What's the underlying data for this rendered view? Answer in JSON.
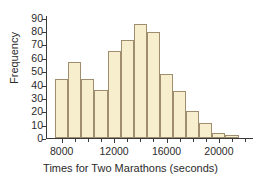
{
  "chart_data": {
    "type": "bar",
    "title": "",
    "xlabel": "Times for Two Marathons (seconds)",
    "ylabel": "Frequency",
    "bin_width": 1000,
    "bin_starts": [
      7500,
      8500,
      9500,
      10500,
      11500,
      12500,
      13500,
      14500,
      15500,
      16500,
      17500,
      18500,
      19500,
      20500,
      21500
    ],
    "categories": [
      "7500",
      "8500",
      "9500",
      "10500",
      "11500",
      "12500",
      "13500",
      "14500",
      "15500",
      "16500",
      "17500",
      "18500",
      "19500",
      "20500",
      "21500"
    ],
    "values": [
      44,
      57,
      44,
      36,
      65,
      73,
      85,
      79,
      48,
      35,
      20,
      11,
      4,
      2,
      0
    ],
    "xlim": [
      6800,
      22600
    ],
    "ylim": [
      0,
      92
    ],
    "ytick_labels": [
      "0",
      "10",
      "20",
      "30",
      "40",
      "50",
      "60",
      "70",
      "80",
      "90"
    ],
    "ytick_values": [
      0,
      10,
      20,
      30,
      40,
      50,
      60,
      70,
      80,
      90
    ],
    "xtick_labels": [
      "8000",
      "12000",
      "16000",
      "20000"
    ],
    "xtick_values": [
      8000,
      12000,
      16000,
      20000
    ],
    "xtick_minor_values": [
      9000,
      10000,
      11000,
      13000,
      14000,
      15000,
      17000,
      18000,
      19000,
      21000,
      22000
    ],
    "grid": false,
    "legend": "none",
    "bar_fill_color": "#f7eecd",
    "bar_edge_color": "#9e8e6e",
    "axis_color": "#3a3a3a",
    "text_color": "#2b2b2b",
    "background_color": "#ffffff"
  }
}
